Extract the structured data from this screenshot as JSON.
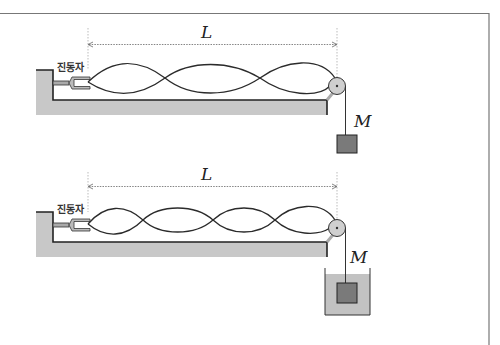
{
  "figure": {
    "frame_color": "#777777",
    "ground_color": "#c8c8c8",
    "string_color": "#2b2b2b",
    "mass_color": "#7a7a7a",
    "water_color": "#c2c2c2",
    "pulley_color": "#cfcfcf"
  },
  "top_setup": {
    "vibrator_label": "진동자",
    "length_label": "L",
    "mass_label": "M",
    "loops": 3,
    "mass_in_water": false
  },
  "bottom_setup": {
    "vibrator_label": "진동자",
    "length_label": "L",
    "mass_label": "M",
    "loops": 4,
    "mass_in_water": true
  }
}
